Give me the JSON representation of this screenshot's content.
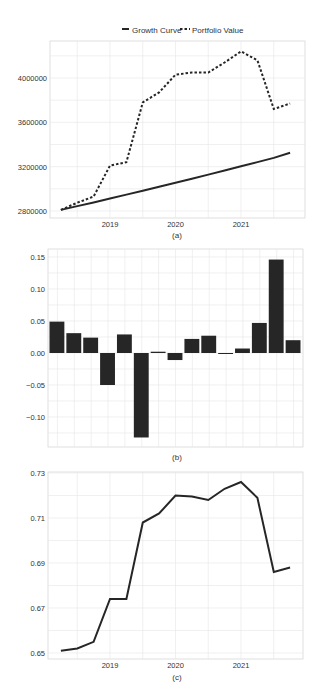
{
  "legend": {
    "growth_label": "Growth Curve",
    "portfolio_label": "Portfolio Value"
  },
  "colors": {
    "line": "#262626",
    "bar": "#262626",
    "grid": "#e6e6e6",
    "axis": "#d0d0d0",
    "text": "#333333"
  },
  "chart_data": [
    {
      "id": "a",
      "type": "line",
      "caption": "(a)",
      "title": "",
      "xlabel": "",
      "ylabel": "",
      "x": [
        2018.25,
        2018.5,
        2018.75,
        2019.0,
        2019.25,
        2019.5,
        2019.75,
        2020.0,
        2020.25,
        2020.5,
        2020.75,
        2021.0,
        2021.25,
        2021.5,
        2021.75
      ],
      "series": [
        {
          "name": "Growth Curve",
          "style": "solid",
          "values": [
            2810000,
            2844000,
            2878000,
            2913000,
            2948000,
            2983000,
            3019000,
            3055000,
            3091000,
            3128000,
            3165000,
            3203000,
            3241000,
            3279000,
            3325000
          ]
        },
        {
          "name": "Portfolio Value",
          "style": "dashed",
          "values": [
            2810000,
            2875000,
            2930000,
            3210000,
            3240000,
            3780000,
            3870000,
            4030000,
            4050000,
            4050000,
            4140000,
            4240000,
            4160000,
            3720000,
            3770000
          ]
        }
      ],
      "yticks": [
        2800000,
        3200000,
        3600000,
        4000000
      ],
      "ytick_labels": [
        "2800000",
        "3200000",
        "3600000",
        "4000000"
      ],
      "xticks": [
        2019,
        2020,
        2021
      ],
      "xtick_labels": [
        "2019",
        "2020",
        "2021"
      ],
      "ylim": [
        2740000,
        4330000
      ],
      "xlim": [
        2018.1,
        2021.9
      ],
      "grid": true,
      "legend_position": "top"
    },
    {
      "id": "b",
      "type": "bar",
      "caption": "(b)",
      "title": "",
      "xlabel": "",
      "ylabel": "",
      "categories": [
        "2018Q2",
        "2018Q3",
        "2018Q4",
        "2019Q1",
        "2019Q2",
        "2019Q3",
        "2019Q4",
        "2020Q1",
        "2020Q2",
        "2020Q3",
        "2020Q4",
        "2021Q1",
        "2021Q2",
        "2021Q3",
        "2021Q4"
      ],
      "values": [
        0.049,
        0.031,
        0.024,
        -0.05,
        0.029,
        -0.132,
        0.002,
        -0.011,
        0.022,
        0.027,
        -0.001,
        0.007,
        0.047,
        0.146,
        0.02
      ],
      "yticks": [
        -0.1,
        -0.05,
        0.0,
        0.05,
        0.1,
        0.15
      ],
      "ytick_labels": [
        "−0.10",
        "−0.05",
        "0.00",
        "0.05",
        "0.10",
        "0.15"
      ],
      "ylim": [
        -0.147,
        0.162
      ],
      "grid": true
    },
    {
      "id": "c",
      "type": "line",
      "caption": "(c)",
      "title": "",
      "xlabel": "",
      "ylabel": "",
      "x": [
        2018.25,
        2018.5,
        2018.75,
        2019.0,
        2019.25,
        2019.5,
        2019.75,
        2020.0,
        2020.25,
        2020.5,
        2020.75,
        2021.0,
        2021.25,
        2021.5,
        2021.75
      ],
      "values": [
        0.651,
        0.652,
        0.655,
        0.674,
        0.674,
        0.708,
        0.712,
        0.72,
        0.7195,
        0.718,
        0.723,
        0.726,
        0.719,
        0.686,
        0.688
      ],
      "yticks": [
        0.65,
        0.67,
        0.69,
        0.71,
        0.73
      ],
      "ytick_labels": [
        "0.65",
        "0.67",
        "0.69",
        "0.71",
        "0.73"
      ],
      "xticks": [
        2019,
        2020,
        2021
      ],
      "xtick_labels": [
        "2019",
        "2020",
        "2021"
      ],
      "ylim": [
        0.6485,
        0.7305
      ],
      "xlim": [
        2018.1,
        2021.9
      ],
      "grid": true
    }
  ]
}
